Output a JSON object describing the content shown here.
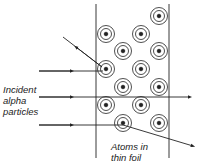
{
  "labels": {
    "incident": [
      "Incident",
      "alpha",
      "particles"
    ],
    "foil": [
      "Atoms in",
      "thin foil"
    ]
  },
  "colors": {
    "stroke": "#222222",
    "background": "#ffffff"
  },
  "foil": {
    "left_x": 96,
    "right_x": 169,
    "top_y": 4,
    "bottom_y": 158
  },
  "atoms": [
    {
      "x": 159,
      "y": 16
    },
    {
      "x": 106,
      "y": 34
    },
    {
      "x": 141,
      "y": 34
    },
    {
      "x": 123,
      "y": 51
    },
    {
      "x": 159,
      "y": 51
    },
    {
      "x": 106,
      "y": 69
    },
    {
      "x": 141,
      "y": 69
    },
    {
      "x": 123,
      "y": 87
    },
    {
      "x": 159,
      "y": 87
    },
    {
      "x": 106,
      "y": 105
    },
    {
      "x": 141,
      "y": 105
    },
    {
      "x": 123,
      "y": 123
    },
    {
      "x": 159,
      "y": 123
    }
  ],
  "particle_paths": [
    {
      "name": "reflected",
      "points": [
        [
          39,
          71
        ],
        [
          104,
          71
        ]
      ],
      "out": [
        [
          102,
          67
        ],
        [
          63,
          37
        ]
      ]
    },
    {
      "name": "undeflected",
      "points": [
        [
          39,
          97
        ],
        [
          194,
          97
        ]
      ]
    },
    {
      "name": "deflected",
      "points": [
        [
          39,
          125
        ],
        [
          123,
          125
        ]
      ],
      "out": [
        [
          123,
          125
        ],
        [
          194,
          146
        ]
      ]
    }
  ]
}
